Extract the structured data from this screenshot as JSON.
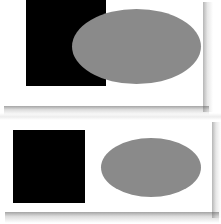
{
  "figure": {
    "background_color": "#ffffff",
    "panel_color": "#ffffff",
    "square_color": "#000000",
    "ellipse_color": "#8a8a8a",
    "shadow_color": "#5a5a5a",
    "panel_count": 2
  },
  "panels": [
    {
      "id": "top",
      "label": "Top panel",
      "relationship": "overlapping",
      "shapes": [
        {
          "name": "black-square",
          "type": "rectangle",
          "fill": "#000000",
          "x": 26,
          "y": 0,
          "width": 80,
          "height": 86,
          "z_order": 1
        },
        {
          "name": "gray-ellipse",
          "type": "ellipse",
          "fill": "#8a8a8a",
          "x": 72,
          "y": 9,
          "width": 129,
          "height": 75,
          "z_order": 2
        }
      ]
    },
    {
      "id": "bottom",
      "label": "Bottom panel",
      "relationship": "separated",
      "shapes": [
        {
          "name": "black-square",
          "type": "rectangle",
          "fill": "#000000",
          "x": 13,
          "y": 10,
          "width": 72,
          "height": 73,
          "z_order": 1
        },
        {
          "name": "gray-ellipse",
          "type": "ellipse",
          "fill": "#8a8a8a",
          "x": 101,
          "y": 18,
          "width": 100,
          "height": 59,
          "z_order": 2
        }
      ]
    }
  ]
}
